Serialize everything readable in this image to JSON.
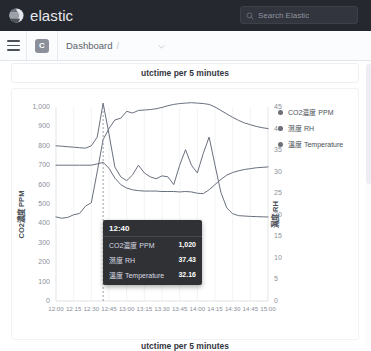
{
  "topbar": {
    "brand_name": "elastic",
    "brand_icon": "elastic-logo-icon",
    "search": {
      "icon": "search-icon",
      "placeholder": "Search Elastic",
      "value": ""
    }
  },
  "appbar": {
    "menu_icon": "hamburger-menu-icon",
    "space_badge": "C",
    "breadcrumb": "Dashboard",
    "breadcrumb_divider": "/",
    "chevron_icon": "chevron-down-icon"
  },
  "panel": {
    "title": "utctime per 5 minutes"
  },
  "colors": {
    "line": "#69707d",
    "tooltip_bg": "#2f3135",
    "axis_text": "#8a8f99",
    "topbar_bg": "#25282f"
  },
  "tooltip": {
    "time": "12:40",
    "rows": [
      {
        "name": "CO2濃度 PPM",
        "value": "1,020"
      },
      {
        "name": "濕度 RH",
        "value": "37.43"
      },
      {
        "name": "溫度 Temperature",
        "value": "32.16"
      }
    ]
  },
  "chart_data": {
    "type": "line",
    "title": "utctime per 5 minutes",
    "xlabel": "utctime per 5 minutes",
    "ylabel": "CO2濃度 PPM",
    "y2label": "濕度 RH",
    "grid": true,
    "legend_position": "right",
    "xlim": [
      "12:00",
      "15:00"
    ],
    "ylim": [
      0,
      1000
    ],
    "y2lim": [
      0,
      45
    ],
    "yticks": [
      0,
      100,
      200,
      300,
      400,
      500,
      600,
      700,
      800,
      900,
      1000
    ],
    "ytick_labels": [
      "0",
      "100",
      "200",
      "300",
      "400",
      "500",
      "600",
      "700",
      "800",
      "900",
      "1,000"
    ],
    "y2ticks": [
      0,
      5,
      10,
      15,
      20,
      25,
      30,
      35,
      40,
      45
    ],
    "y2tick_labels": [
      "0",
      "5",
      "10",
      "15",
      "20",
      "25",
      "30",
      "35",
      "40",
      "45"
    ],
    "xticks": [
      "12:00",
      "12:15",
      "12:30",
      "12:45",
      "13:00",
      "13:15",
      "13:30",
      "13:45",
      "14:00",
      "14:15",
      "14:30",
      "14:45",
      "15:00"
    ],
    "cursor_x": "12:40",
    "x": [
      "12:00",
      "12:05",
      "12:10",
      "12:15",
      "12:20",
      "12:25",
      "12:30",
      "12:35",
      "12:40",
      "12:45",
      "12:50",
      "12:55",
      "13:00",
      "13:05",
      "13:10",
      "13:15",
      "13:20",
      "13:25",
      "13:30",
      "13:35",
      "13:40",
      "13:45",
      "13:50",
      "13:55",
      "14:00",
      "14:05",
      "14:10",
      "14:15",
      "14:20",
      "14:25",
      "14:30",
      "14:35",
      "14:40",
      "14:45",
      "14:50",
      "14:55",
      "15:00"
    ],
    "series": [
      {
        "name": "CO2濃度 PPM",
        "axis": "left",
        "values": [
          800,
          798,
          795,
          793,
          790,
          788,
          800,
          845,
          1020,
          860,
          690,
          640,
          620,
          650,
          700,
          660,
          640,
          630,
          645,
          640,
          600,
          700,
          780,
          700,
          660,
          760,
          845,
          700,
          560,
          480,
          450,
          440,
          438,
          436,
          435,
          434,
          433
        ]
      },
      {
        "name": "濕度 RH",
        "axis": "right",
        "values": [
          19.5,
          19.2,
          19.4,
          20.0,
          20.3,
          22.0,
          22.8,
          30.0,
          37.43,
          40.0,
          42.0,
          42.4,
          44.0,
          43.6,
          44.2,
          44.3,
          44.4,
          44.6,
          44.9,
          45.3,
          45.6,
          45.8,
          45.9,
          46.0,
          45.9,
          45.8,
          45.6,
          45.0,
          44.2,
          43.4,
          42.6,
          41.9,
          41.3,
          40.9,
          40.5,
          40.2,
          40.0
        ]
      },
      {
        "name": "溫度 Temperature",
        "axis": "right",
        "values": [
          31.5,
          31.5,
          31.5,
          31.5,
          31.5,
          31.5,
          31.5,
          31.8,
          32.16,
          30.8,
          28.5,
          27.0,
          26.2,
          25.8,
          25.6,
          25.5,
          25.5,
          25.5,
          25.4,
          25.4,
          25.4,
          25.3,
          25.4,
          25.3,
          25.0,
          24.9,
          25.8,
          27.0,
          28.2,
          29.2,
          29.8,
          30.2,
          30.5,
          30.7,
          30.9,
          31.0,
          31.1
        ]
      }
    ]
  }
}
